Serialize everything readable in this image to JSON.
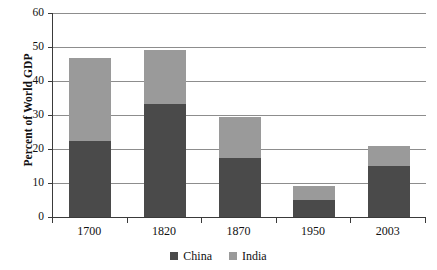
{
  "chart_data": {
    "type": "bar",
    "subtype": "stacked-vertical",
    "title": "",
    "xlabel": "",
    "ylabel": "Percent of World GDP",
    "categories": [
      "1700",
      "1820",
      "1870",
      "1950",
      "2003"
    ],
    "series": [
      {
        "name": "China",
        "color": "#4a4a4a",
        "values": [
          22.5,
          33.3,
          17.5,
          5.0,
          15.0
        ]
      },
      {
        "name": "India",
        "color": "#9a9a9a",
        "values": [
          24.2,
          15.7,
          11.8,
          4.2,
          6.0
        ]
      }
    ],
    "totals": [
      46.7,
      49.0,
      29.3,
      9.2,
      21.0
    ],
    "ylim": [
      0,
      60
    ],
    "yticks": [
      0,
      10,
      20,
      30,
      40,
      50,
      60
    ],
    "ytick_labels": [
      "0",
      "10",
      "20",
      "30",
      "40",
      "50",
      "60"
    ],
    "grid": true,
    "grid_axis": "y",
    "legend_position": "bottom-center",
    "legend_entries": [
      "China",
      "India"
    ]
  },
  "axis": {
    "y_title": "Percent of World GDP"
  },
  "legend": {
    "items": [
      {
        "label": "China"
      },
      {
        "label": "India"
      }
    ]
  },
  "colors": {
    "china": "#4a4a4a",
    "india": "#9a9a9a",
    "gridline": "#8d8d8d",
    "axis": "#3a3a3a",
    "background": "#ffffff"
  }
}
